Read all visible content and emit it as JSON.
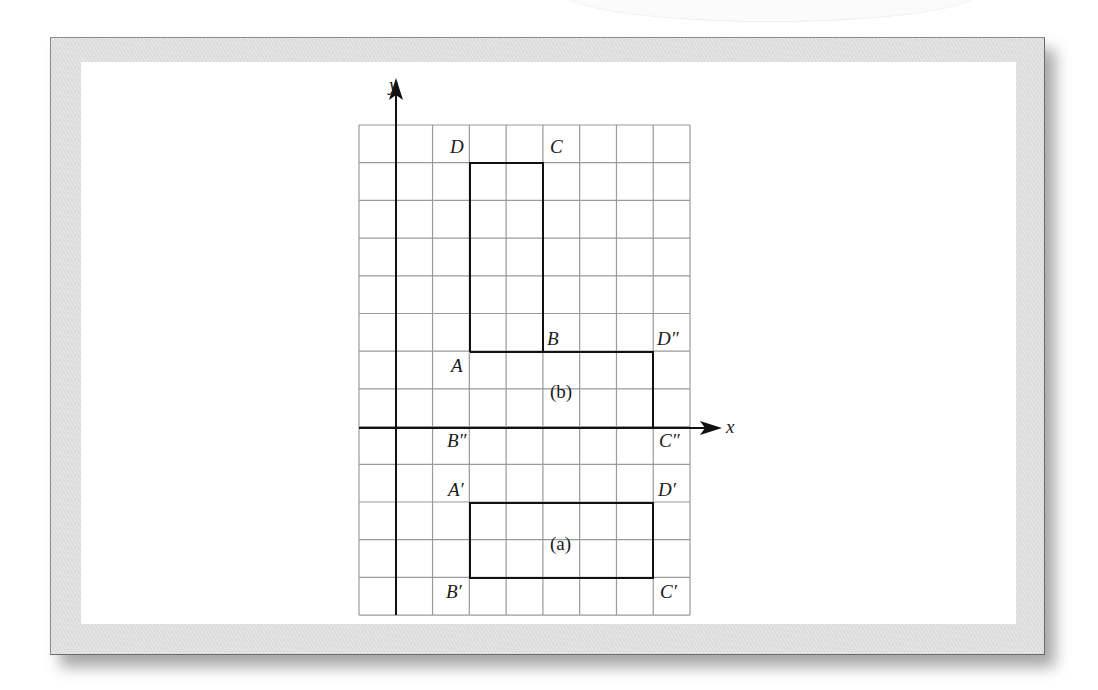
{
  "figure": {
    "axes": {
      "x_label": "x",
      "y_label": "y",
      "origin_px": [
        396,
        428
      ],
      "cell_w": 36.78,
      "cell_h": 37.7,
      "x_range": [
        -1,
        8
      ],
      "y_range": [
        -5,
        8
      ]
    },
    "grid": {
      "color": "#9a9a9a",
      "left": 359,
      "top": 125,
      "cols": 9,
      "rows": 13
    },
    "shapes": [
      {
        "id": "original",
        "vertices": [
          {
            "name": "A",
            "x": 2,
            "y": 2
          },
          {
            "name": "B",
            "x": 4,
            "y": 2
          },
          {
            "name": "C",
            "x": 4,
            "y": 7
          },
          {
            "name": "D",
            "x": 2,
            "y": 7
          }
        ]
      },
      {
        "id": "b",
        "caption": "(b)",
        "vertices": [
          {
            "name": "A",
            "x": 2,
            "y": 2
          },
          {
            "name": "B″",
            "x": 2,
            "y": 0
          },
          {
            "name": "C″",
            "x": 7,
            "y": 0
          },
          {
            "name": "D″",
            "x": 7,
            "y": 2
          }
        ]
      },
      {
        "id": "a",
        "caption": "(a)",
        "vertices": [
          {
            "name": "A′",
            "x": 2,
            "y": -2
          },
          {
            "name": "B′",
            "x": 2,
            "y": -4
          },
          {
            "name": "C′",
            "x": 7,
            "y": -4
          },
          {
            "name": "D′",
            "x": 7,
            "y": -2
          }
        ]
      }
    ],
    "labels": {
      "D": "D",
      "C": "C",
      "B": "B",
      "A": "A",
      "D2": "D″",
      "B2": "B″",
      "C2": "C″",
      "A1": "A′",
      "D1": "D′",
      "B1": "B′",
      "C1": "C′",
      "cap_b": "(b)",
      "cap_a": "(a)"
    }
  }
}
